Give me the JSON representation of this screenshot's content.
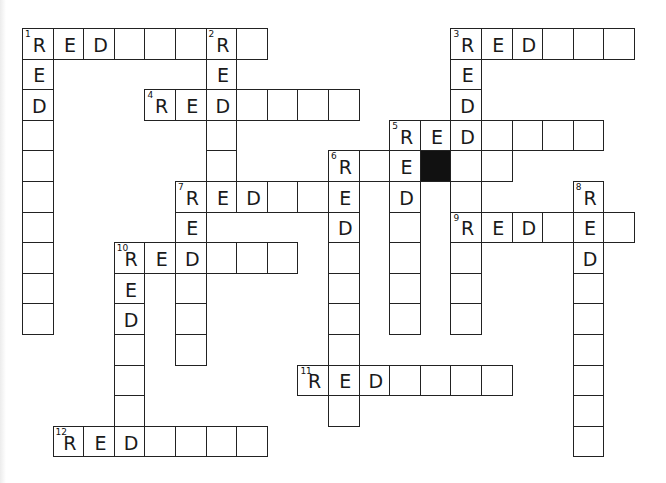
{
  "puzzle": {
    "type": "crossword",
    "grid": {
      "origin_x": 22,
      "origin_y": 28,
      "pitch": 30.6
    },
    "colors": {
      "border": "#222222",
      "block": "#111111",
      "text": "#1a1a1a",
      "background": "#ffffff"
    },
    "words": [
      {
        "number": 1,
        "direction": "across",
        "row": 0,
        "col": 0,
        "length": 8
      },
      {
        "number": 1,
        "direction": "down",
        "row": 0,
        "col": 0,
        "length": 10
      },
      {
        "number": 2,
        "direction": "down",
        "row": 0,
        "col": 6,
        "length": 6
      },
      {
        "number": 3,
        "direction": "across",
        "row": 0,
        "col": 14,
        "length": 6
      },
      {
        "number": 3,
        "direction": "down",
        "row": 0,
        "col": 14,
        "length": 10
      },
      {
        "number": 4,
        "direction": "across",
        "row": 2,
        "col": 4,
        "length": 7
      },
      {
        "number": 5,
        "direction": "across",
        "row": 3,
        "col": 12,
        "length": 7
      },
      {
        "number": 5,
        "direction": "down",
        "row": 3,
        "col": 12,
        "length": 7
      },
      {
        "number": 6,
        "direction": "across",
        "row": 4,
        "col": 10,
        "length": 6
      },
      {
        "number": 6,
        "direction": "down",
        "row": 4,
        "col": 10,
        "length": 9
      },
      {
        "number": 7,
        "direction": "across",
        "row": 5,
        "col": 5,
        "length": 6
      },
      {
        "number": 7,
        "direction": "down",
        "row": 5,
        "col": 5,
        "length": 6
      },
      {
        "number": 8,
        "direction": "down",
        "row": 5,
        "col": 18,
        "length": 9
      },
      {
        "number": 9,
        "direction": "across",
        "row": 6,
        "col": 14,
        "length": 6
      },
      {
        "number": 10,
        "direction": "across",
        "row": 7,
        "col": 3,
        "length": 6
      },
      {
        "number": 10,
        "direction": "down",
        "row": 7,
        "col": 3,
        "length": 7
      },
      {
        "number": 11,
        "direction": "across",
        "row": 11,
        "col": 9,
        "length": 7
      },
      {
        "number": 12,
        "direction": "across",
        "row": 13,
        "col": 1,
        "length": 7
      }
    ],
    "filled_prefix": "RED",
    "blocks": [
      {
        "row": 4,
        "col": 13
      }
    ],
    "numbers": [
      {
        "label": "1",
        "row": 0,
        "col": 0
      },
      {
        "label": "2",
        "row": 0,
        "col": 6
      },
      {
        "label": "3",
        "row": 0,
        "col": 14
      },
      {
        "label": "4",
        "row": 2,
        "col": 4
      },
      {
        "label": "5",
        "row": 3,
        "col": 12
      },
      {
        "label": "6",
        "row": 4,
        "col": 10
      },
      {
        "label": "7",
        "row": 5,
        "col": 5
      },
      {
        "label": "8",
        "row": 5,
        "col": 18
      },
      {
        "label": "9",
        "row": 6,
        "col": 14
      },
      {
        "label": "10",
        "row": 7,
        "col": 3
      },
      {
        "label": "11",
        "row": 11,
        "col": 9
      },
      {
        "label": "12",
        "row": 13,
        "col": 1
      }
    ],
    "visible_letters": [
      {
        "row": 0,
        "col": 0,
        "ch": "R"
      },
      {
        "row": 0,
        "col": 1,
        "ch": "E"
      },
      {
        "row": 0,
        "col": 2,
        "ch": "D"
      },
      {
        "row": 0,
        "col": 6,
        "ch": "R"
      },
      {
        "row": 1,
        "col": 0,
        "ch": "E"
      },
      {
        "row": 2,
        "col": 0,
        "ch": "D"
      },
      {
        "row": 1,
        "col": 6,
        "ch": "E"
      },
      {
        "row": 2,
        "col": 6,
        "ch": "D"
      },
      {
        "row": 0,
        "col": 14,
        "ch": "R"
      },
      {
        "row": 0,
        "col": 15,
        "ch": "E"
      },
      {
        "row": 0,
        "col": 16,
        "ch": "D"
      },
      {
        "row": 1,
        "col": 14,
        "ch": "E"
      },
      {
        "row": 2,
        "col": 14,
        "ch": "D"
      },
      {
        "row": 2,
        "col": 4,
        "ch": "R"
      },
      {
        "row": 2,
        "col": 5,
        "ch": "E"
      },
      {
        "row": 3,
        "col": 12,
        "ch": "R"
      },
      {
        "row": 3,
        "col": 13,
        "ch": "E"
      },
      {
        "row": 3,
        "col": 14,
        "ch": "D"
      },
      {
        "row": 4,
        "col": 12,
        "ch": "E"
      },
      {
        "row": 5,
        "col": 12,
        "ch": "D"
      },
      {
        "row": 4,
        "col": 10,
        "ch": "R"
      },
      {
        "row": 5,
        "col": 10,
        "ch": "E"
      },
      {
        "row": 6,
        "col": 10,
        "ch": "D"
      },
      {
        "row": 4,
        "col": 12,
        "ch": "D"
      },
      {
        "row": 5,
        "col": 5,
        "ch": "R"
      },
      {
        "row": 5,
        "col": 6,
        "ch": "E"
      },
      {
        "row": 5,
        "col": 7,
        "ch": "D"
      },
      {
        "row": 6,
        "col": 5,
        "ch": "E"
      },
      {
        "row": 7,
        "col": 5,
        "ch": "D"
      },
      {
        "row": 5,
        "col": 18,
        "ch": "R"
      },
      {
        "row": 6,
        "col": 18,
        "ch": "E"
      },
      {
        "row": 7,
        "col": 18,
        "ch": "D"
      },
      {
        "row": 6,
        "col": 14,
        "ch": "R"
      },
      {
        "row": 6,
        "col": 15,
        "ch": "E"
      },
      {
        "row": 6,
        "col": 16,
        "ch": "D"
      },
      {
        "row": 7,
        "col": 3,
        "ch": "R"
      },
      {
        "row": 7,
        "col": 4,
        "ch": "E"
      },
      {
        "row": 8,
        "col": 3,
        "ch": "E"
      },
      {
        "row": 9,
        "col": 3,
        "ch": "D"
      },
      {
        "row": 11,
        "col": 9,
        "ch": "R"
      },
      {
        "row": 11,
        "col": 10,
        "ch": "E"
      },
      {
        "row": 11,
        "col": 11,
        "ch": "D"
      },
      {
        "row": 13,
        "col": 1,
        "ch": "R"
      },
      {
        "row": 13,
        "col": 2,
        "ch": "E"
      },
      {
        "row": 13,
        "col": 3,
        "ch": "D"
      }
    ]
  }
}
